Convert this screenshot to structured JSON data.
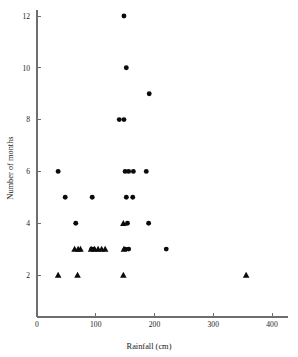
{
  "chart_data": {
    "type": "scatter",
    "title": "",
    "xlabel": "Rainfall (cm)",
    "ylabel": "Number of months",
    "xlim": [
      0,
      420
    ],
    "ylim": [
      0,
      12.9
    ],
    "grid": false,
    "legend": "none",
    "xticks": [
      0,
      100,
      200,
      300,
      400
    ],
    "xticklabels": [
      "0",
      "100",
      "200",
      "300",
      "400"
    ],
    "yticks": [
      2,
      4,
      6,
      8,
      10,
      12
    ],
    "yticklabels": [
      "2",
      "4",
      "6",
      "8",
      "10",
      "12"
    ],
    "series": [
      {
        "name": "circles",
        "marker": "circle",
        "color": "#0b0b0b",
        "points": [
          {
            "x": 148,
            "y": 12
          },
          {
            "x": 152,
            "y": 10
          },
          {
            "x": 191,
            "y": 9
          },
          {
            "x": 140,
            "y": 8
          },
          {
            "x": 148,
            "y": 8
          },
          {
            "x": 36,
            "y": 6
          },
          {
            "x": 150,
            "y": 6
          },
          {
            "x": 156,
            "y": 6
          },
          {
            "x": 164,
            "y": 6
          },
          {
            "x": 186,
            "y": 6
          },
          {
            "x": 48,
            "y": 5
          },
          {
            "x": 94,
            "y": 5
          },
          {
            "x": 152,
            "y": 5
          },
          {
            "x": 163,
            "y": 5
          },
          {
            "x": 66,
            "y": 4
          },
          {
            "x": 154,
            "y": 4
          },
          {
            "x": 190,
            "y": 4
          },
          {
            "x": 93,
            "y": 3
          },
          {
            "x": 96,
            "y": 3
          },
          {
            "x": 150,
            "y": 3
          },
          {
            "x": 156,
            "y": 3
          },
          {
            "x": 220,
            "y": 3
          }
        ]
      },
      {
        "name": "triangles",
        "marker": "triangle",
        "color": "#0b0b0b",
        "points": [
          {
            "x": 64,
            "y": 3
          },
          {
            "x": 70,
            "y": 3
          },
          {
            "x": 74,
            "y": 3
          },
          {
            "x": 92,
            "y": 3
          },
          {
            "x": 98,
            "y": 3
          },
          {
            "x": 104,
            "y": 3
          },
          {
            "x": 110,
            "y": 3
          },
          {
            "x": 116,
            "y": 3
          },
          {
            "x": 147,
            "y": 4
          },
          {
            "x": 148,
            "y": 3
          },
          {
            "x": 36,
            "y": 2
          },
          {
            "x": 69,
            "y": 2
          },
          {
            "x": 147,
            "y": 2
          },
          {
            "x": 356,
            "y": 2
          }
        ]
      }
    ]
  },
  "axes": {
    "x_title": "Rainfall (cm)",
    "y_title": "Number of months"
  }
}
